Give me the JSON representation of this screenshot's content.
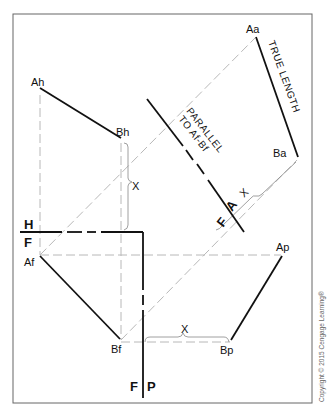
{
  "diagram": {
    "type": "descriptive geometry - auxiliary view true length",
    "points": {
      "Ah": "Ah",
      "Bh": "Bh",
      "Aa": "Aa",
      "Ba": "Ba",
      "Af": "Af",
      "Bf": "Bf",
      "Ap": "Ap",
      "Bp": "Bp"
    },
    "dimension_label": "X",
    "annotations": {
      "true_length": "TRUE LENGTH",
      "parallel_line1": "PARALLEL",
      "parallel_line2": "TO Af-Bf"
    },
    "fold_lines": {
      "hf_top": "H",
      "hf_bottom": "F",
      "af_a": "A",
      "af_f": "F",
      "fp_f": "F",
      "fp_p": "P"
    },
    "copyright": "Copyright © 2015 Cengage Learning®",
    "colors": {
      "object_line": "#111111",
      "projection_line": "#b5b5b5",
      "border": "#555555"
    }
  }
}
